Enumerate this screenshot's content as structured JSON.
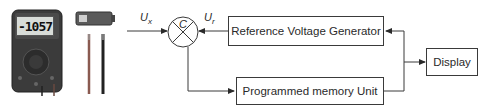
{
  "diagram": {
    "type": "block-diagram",
    "instrument": {
      "name": "digital multimeter",
      "display_reading": "-1057",
      "accessories": [
        "battery",
        "test leads (red, black)"
      ]
    },
    "signals": {
      "input": {
        "symbol": "U",
        "subscript": "x"
      },
      "reference": {
        "symbol": "U",
        "subscript": "r"
      }
    },
    "comparator": {
      "label": "C"
    },
    "blocks": {
      "reference_generator": "Reference Voltage Generator",
      "memory_unit": "Programmed memory Unit",
      "display": "Display"
    },
    "colors": {
      "line": "#3a3a3a",
      "box_border": "#3a3a3a",
      "text": "#2a2a2a",
      "meter_body": "#3b3b3b",
      "lead_red": "#8a5a50",
      "lead_black": "#222222"
    }
  }
}
